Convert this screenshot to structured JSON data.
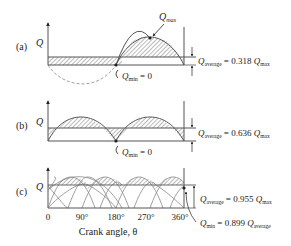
{
  "panels": [
    {
      "id": "a",
      "label": "(a)",
      "y_axis_label": "Q",
      "max_label": "Q",
      "max_sub": "max",
      "min_label": "Q",
      "min_sub": "min",
      "min_value": " = 0",
      "avg_label": "Q",
      "avg_sub": "average",
      "avg_value": " = 0.318 ",
      "avg_ref": "Q",
      "avg_ref_sub": "max"
    },
    {
      "id": "b",
      "label": "(b)",
      "y_axis_label": "Q",
      "min_label": "Q",
      "min_sub": "min",
      "min_value": " = 0",
      "avg_label": "Q",
      "avg_sub": "average",
      "avg_value": " = 0.636 ",
      "avg_ref": "Q",
      "avg_ref_sub": "max"
    },
    {
      "id": "c",
      "label": "(c)",
      "y_axis_label": "Q",
      "avg_label": "Q",
      "avg_sub": "average",
      "avg_value": " = 0.955 ",
      "avg_ref": "Q",
      "avg_ref_sub": "max",
      "min_label": "Q",
      "min_sub": "min",
      "min_value": " = 0.899 ",
      "min_ref": "Q",
      "min_ref_sub": "average",
      "x_ticks": [
        "0",
        "90°",
        "180°",
        "270°",
        "360°"
      ],
      "x_axis_label": "Crank angle, θ"
    }
  ],
  "colors": {
    "line": "#555555",
    "hatch": "#666666",
    "text": "#222222"
  }
}
